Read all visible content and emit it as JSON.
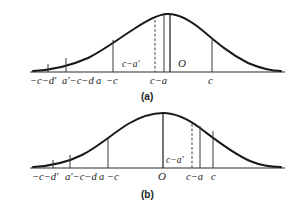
{
  "figure": {
    "title": "",
    "panels": [
      {
        "id": "panel-a",
        "caption": "(a)",
        "axis": {
          "y": 72,
          "x_start": 30,
          "x_end": 285
        },
        "curve": {
          "peak_x": 166,
          "peak_y": 14,
          "left_foot_x": 33,
          "right_foot_x": 281,
          "description": "bell-shaped density curve, peak skewed to the right of panel center"
        },
        "verticals": [
          {
            "name": "tick-minus-c-minus-dprime",
            "x": 48,
            "top_y": 64,
            "style": "solid"
          },
          {
            "name": "tick-aprime-minus-c-minus-d",
            "x": 66,
            "top_y": 58,
            "style": "solid"
          },
          {
            "name": "tick-minus-c",
            "x": 113,
            "top_y": 40,
            "style": "solid"
          },
          {
            "name": "tick-c-minus-a-dashed",
            "x": 155,
            "top_y": 20,
            "style": "dashed"
          },
          {
            "name": "tick-c-minus-a",
            "x": 164,
            "top_y": 15,
            "style": "solid"
          },
          {
            "name": "tick-origin",
            "x": 170,
            "top_y": 15,
            "style": "bold"
          },
          {
            "name": "tick-c",
            "x": 212,
            "top_y": 38,
            "style": "solid"
          }
        ],
        "inline_labels": [
          {
            "name": "label-c-minus-a-prime-inline",
            "text": "c−a′",
            "x": 122,
            "y": 67
          },
          {
            "name": "label-origin",
            "text": "O",
            "x": 178,
            "y": 67
          }
        ],
        "tick_labels": [
          {
            "name": "axis-label-minus-c-minus-dprime",
            "text": "−c−d′",
            "x": 30,
            "y": 84
          },
          {
            "name": "axis-label-aprime-minus-c-minus-d",
            "text": "a′−c−d",
            "x": 62,
            "y": 84
          },
          {
            "name": "axis-label-a",
            "text": "a",
            "x": 96,
            "y": 84
          },
          {
            "name": "axis-label-minus-c",
            "text": "−c",
            "x": 106,
            "y": 84
          },
          {
            "name": "axis-label-c-minus-a",
            "text": "c−a",
            "x": 150,
            "y": 84
          },
          {
            "name": "axis-label-c",
            "text": "c",
            "x": 208,
            "y": 84
          }
        ]
      },
      {
        "id": "panel-b",
        "caption": "(b)",
        "axis": {
          "y": 168,
          "x_start": 30,
          "x_end": 285
        },
        "curve": {
          "peak_x": 163,
          "peak_y": 113,
          "left_foot_x": 33,
          "right_foot_x": 281,
          "description": "bell-shaped density curve, peak near panel center"
        },
        "verticals": [
          {
            "name": "tick-minus-c-minus-dprime",
            "x": 53,
            "top_y": 160,
            "style": "solid"
          },
          {
            "name": "tick-aprime-minus-c-minus-d",
            "x": 70,
            "top_y": 155,
            "style": "solid"
          },
          {
            "name": "tick-minus-c",
            "x": 108,
            "top_y": 139,
            "style": "solid"
          },
          {
            "name": "tick-origin",
            "x": 163,
            "top_y": 114,
            "style": "bold"
          },
          {
            "name": "tick-c-minus-a-dashed",
            "x": 192,
            "top_y": 124,
            "style": "dashed"
          },
          {
            "name": "tick-c-minus-a",
            "x": 200,
            "top_y": 126,
            "style": "solid"
          },
          {
            "name": "tick-c",
            "x": 213,
            "top_y": 131,
            "style": "solid"
          }
        ],
        "inline_labels": [
          {
            "name": "label-c-minus-a-prime-inline",
            "text": "c−a′",
            "x": 166,
            "y": 163
          }
        ],
        "tick_labels": [
          {
            "name": "axis-label-minus-c-minus-dprime",
            "text": "−c−d′",
            "x": 32,
            "y": 180
          },
          {
            "name": "axis-label-aprime-minus-c-minus-d",
            "text": "a′−c−d",
            "x": 65,
            "y": 180
          },
          {
            "name": "axis-label-a",
            "text": "a",
            "x": 99,
            "y": 180
          },
          {
            "name": "axis-label-minus-c",
            "text": "−c",
            "x": 107,
            "y": 180
          },
          {
            "name": "axis-label-origin",
            "text": "O",
            "x": 158,
            "y": 180
          },
          {
            "name": "axis-label-c-minus-a",
            "text": "c−a",
            "x": 186,
            "y": 180
          },
          {
            "name": "axis-label-c",
            "text": "c",
            "x": 211,
            "y": 180
          }
        ]
      }
    ],
    "colors": {
      "curve": "#1a1a1a",
      "axis": "#2b2b2b",
      "vertical": "#3a3a3a",
      "background": "#ffffff"
    }
  }
}
